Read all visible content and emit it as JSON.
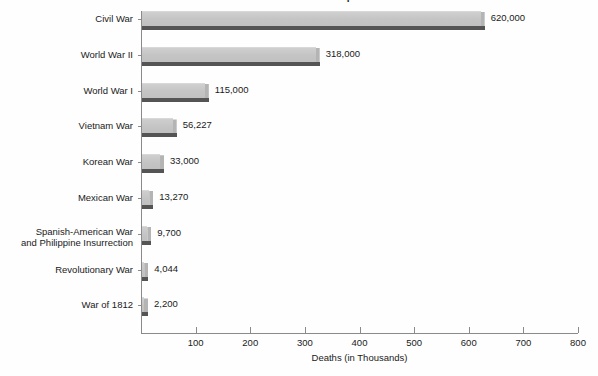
{
  "chart_data": {
    "type": "bar",
    "orientation": "horizontal",
    "title": "Total U.S. War Deaths Comparison",
    "xlabel": "Deaths (in Thousands)",
    "ylabel": "",
    "xlim": [
      0,
      800
    ],
    "xticks": [
      100,
      200,
      300,
      400,
      500,
      600,
      700,
      800
    ],
    "xtick_labels": [
      "100",
      "200",
      "300",
      "400",
      "500",
      "600",
      "700",
      "800"
    ],
    "grid": false,
    "legend": false,
    "units_note": "x axis is in thousands; data labels show absolute deaths",
    "categories": [
      "Civil War",
      "World War II",
      "World War I",
      "Vietnam War",
      "Korean War",
      "Mexican War",
      "Spanish-American War and Philippine Insurrection",
      "Revolutionary War",
      "War of 1812"
    ],
    "category_lines": [
      [
        "Civil War"
      ],
      [
        "World War II"
      ],
      [
        "World War I"
      ],
      [
        "Vietnam War"
      ],
      [
        "Korean War"
      ],
      [
        "Mexican War"
      ],
      [
        "Spanish-American War",
        "and Philippine Insurrection"
      ],
      [
        "Revolutionary War"
      ],
      [
        "War of 1812"
      ]
    ],
    "values": [
      620000,
      318000,
      115000,
      56227,
      33000,
      13270,
      9700,
      4044,
      2200
    ],
    "values_thousands": [
      620,
      318,
      115,
      56.227,
      33,
      13.27,
      9.7,
      4.044,
      2.2
    ],
    "value_labels": [
      "620,000",
      "318,000",
      "115,000",
      "56,227",
      "33,000",
      "13,270",
      "9,700",
      "4,044",
      "2,200"
    ],
    "colors": {
      "bar_face": "#c6c6c6",
      "bar_shadow": "#545454",
      "axis": "#8a8a8a",
      "text": "#1a1a1a",
      "background": "#fefefe"
    }
  }
}
